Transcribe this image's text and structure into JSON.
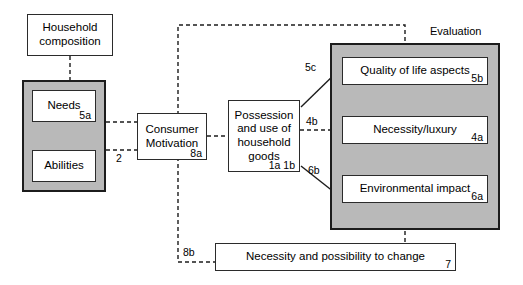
{
  "diagram": {
    "title_label": "Evaluation",
    "nodes": {
      "household": {
        "text": "Household composition",
        "tag": ""
      },
      "needs": {
        "text": "Needs",
        "tag": "5a"
      },
      "abilities": {
        "text": "Abilities",
        "tag": ""
      },
      "consumer_motivation": {
        "text": "Consumer Motivation",
        "tag": "8a"
      },
      "possession": {
        "text": "Possession and use of household goods",
        "tag": "1a 1b"
      },
      "quality_of_life": {
        "text": "Quality of life aspects",
        "tag": "5b"
      },
      "necessity_luxury": {
        "text": "Necessity/luxury",
        "tag": "4a"
      },
      "environmental_impact": {
        "text": "Environmental impact",
        "tag": "6a"
      },
      "necessity_change": {
        "text": "Necessity and possibility to change",
        "tag": "7"
      }
    },
    "connector_labels": {
      "needs_abilities_to_motivation": "2",
      "possession_to_quality": "5c",
      "possession_to_necessity_luxury": "4b",
      "possession_to_environmental": "6b",
      "motivation_to_change": "8b"
    },
    "colors": {
      "panel_fill": "#b9b9b9",
      "panel_border": "#1c1c1c",
      "node_fill": "#ffffff",
      "node_border": "#2b2b2b",
      "line": "#1c1c1c",
      "background": "#ffffff"
    }
  }
}
